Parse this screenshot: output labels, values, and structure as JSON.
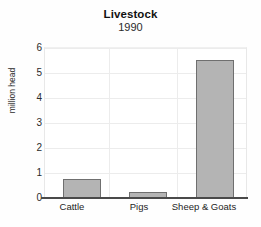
{
  "chart_data": {
    "type": "bar",
    "title": "Livestock",
    "subtitle": "1990",
    "xlabel": "",
    "ylabel": "million head",
    "categories": [
      "Cattle",
      "Pigs",
      "Sheep & Goats"
    ],
    "values": [
      0.76,
      0.25,
      5.5
    ],
    "ylim": [
      0,
      6
    ],
    "yticks": [
      "0",
      "1",
      "2",
      "3",
      "4",
      "5",
      "6"
    ],
    "ytick_values": [
      0,
      1,
      2,
      3,
      4,
      5,
      6
    ],
    "grid": "horizontal-and-vertical",
    "legend": "none",
    "bar_fill_color": "#b4b4b4",
    "bar_edge_color": "#6f6f6f",
    "grid_color": "#ececec",
    "axis_color": "#4a4a4a",
    "background_color": "#ffffff"
  }
}
